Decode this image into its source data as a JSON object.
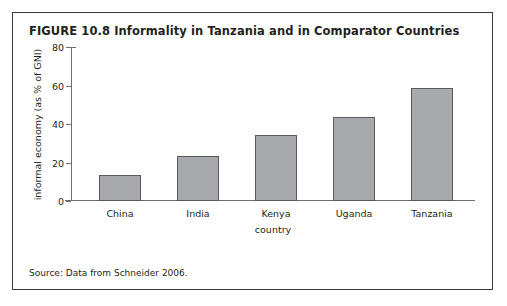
{
  "figure": {
    "title": "FIGURE 10.8  Informality in Tanzania and in Comparator Countries",
    "source_note": "Source: Data from Schneider 2006."
  },
  "colors": {
    "frame_border": "#3a3a3a",
    "bar_fill": "#a7a9ac",
    "bar_border": "#58595b",
    "axis": "#6d6e70",
    "text": "#231f20"
  },
  "chart_data": {
    "type": "bar",
    "title": "FIGURE 10.8  Informality in Tanzania and in Comparator Countries",
    "xlabel": "country",
    "ylabel": "informal economy (as % of GNI)",
    "categories": [
      "China",
      "India",
      "Kenya",
      "Uganda",
      "Tanzania"
    ],
    "values": [
      13.5,
      23.5,
      34.5,
      43.5,
      58.5
    ],
    "ylim": [
      0,
      80
    ],
    "yticks": [
      0,
      20,
      40,
      60,
      80
    ],
    "ytick_labels": [
      "0",
      "20",
      "40",
      "60",
      "80"
    ],
    "grid": false,
    "legend": false,
    "series": [
      {
        "name": "informal economy",
        "values": [
          13.5,
          23.5,
          34.5,
          43.5,
          58.5
        ]
      }
    ],
    "source": "Source: Data from Schneider 2006."
  }
}
